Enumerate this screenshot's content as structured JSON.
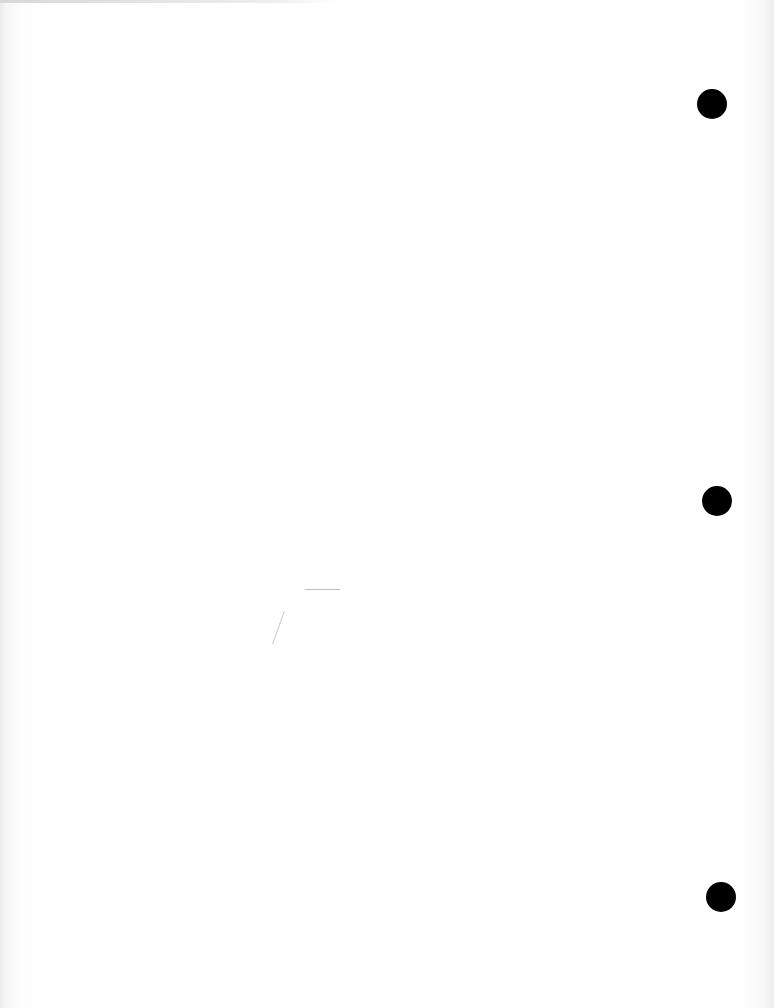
{
  "document": {
    "type": "blank scanned page",
    "text": ""
  },
  "binder_holes": [
    {
      "cx": 712,
      "cy": 104,
      "r": 15
    },
    {
      "cx": 717,
      "cy": 501,
      "r": 15
    },
    {
      "cx": 721,
      "cy": 897,
      "r": 15
    }
  ],
  "colors": {
    "paper": "#ffffff",
    "hole": "#000000"
  }
}
